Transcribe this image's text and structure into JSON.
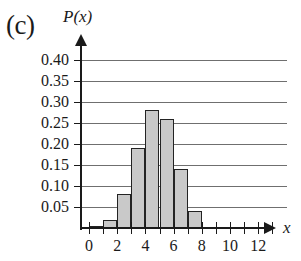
{
  "panel": {
    "label": "(c)"
  },
  "axes": {
    "y_title": "P(x)",
    "x_title": "x",
    "y_tick_labels": [
      "0.05",
      "0.10",
      "0.15",
      "0.20",
      "0.25",
      "0.30",
      "0.35",
      "0.40"
    ],
    "x_tick_labels": [
      "0",
      "2",
      "4",
      "6",
      "8",
      "10",
      "12"
    ]
  },
  "style": {
    "bar_fill": "#c9c9c9",
    "bar_edge": "#232323",
    "grid_color": "#6f6f6f",
    "axis_color": "#1a1a1a",
    "background": "#ffffff"
  },
  "chart_data": {
    "type": "bar",
    "title": "(c)",
    "xlabel": "x",
    "ylabel": "P(x)",
    "categories": [
      0,
      1,
      2,
      3,
      4,
      5,
      6,
      7,
      8,
      9,
      10,
      11,
      12,
      13
    ],
    "values": [
      0.0,
      0.005,
      0.02,
      0.08,
      0.19,
      0.28,
      0.26,
      0.14,
      0.04,
      0.0,
      0.0,
      0.0,
      0.0,
      0.0
    ],
    "xlim": [
      0,
      13
    ],
    "ylim": [
      0,
      0.425
    ],
    "ytick_values": [
      0.05,
      0.1,
      0.15,
      0.2,
      0.25,
      0.3,
      0.35,
      0.4
    ],
    "xtick_values": [
      0,
      1,
      2,
      3,
      4,
      5,
      6,
      7,
      8,
      9,
      10,
      11,
      12,
      13
    ],
    "xtick_labeled_values": [
      0,
      2,
      4,
      6,
      8,
      10,
      12
    ],
    "grid": "horizontal",
    "legend": "none",
    "bar_align": "between-ticks"
  }
}
